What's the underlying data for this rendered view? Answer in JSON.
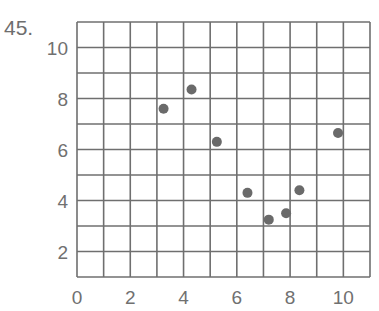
{
  "problem_number": "45.",
  "colors": {
    "grid": "#6f6f6f",
    "point": "#6a6a6a",
    "text": "#707070"
  },
  "chart_data": {
    "type": "scatter",
    "title": "",
    "xlabel": "",
    "ylabel": "",
    "xlim": [
      0,
      11
    ],
    "ylim": [
      1,
      11
    ],
    "grid": true,
    "grid_step": 1,
    "legend": null,
    "x_ticks": [
      0,
      2,
      4,
      6,
      8,
      10
    ],
    "y_ticks": [
      2,
      4,
      6,
      8,
      10
    ],
    "points": [
      {
        "x": 3.25,
        "y": 7.6
      },
      {
        "x": 4.3,
        "y": 8.35
      },
      {
        "x": 5.25,
        "y": 6.3
      },
      {
        "x": 6.4,
        "y": 4.3
      },
      {
        "x": 7.2,
        "y": 3.25
      },
      {
        "x": 7.85,
        "y": 3.5
      },
      {
        "x": 8.35,
        "y": 4.4
      },
      {
        "x": 9.8,
        "y": 6.65
      }
    ]
  }
}
